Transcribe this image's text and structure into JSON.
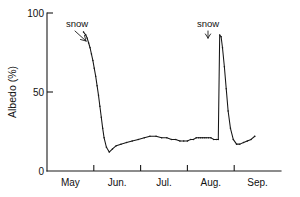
{
  "chart_data": {
    "type": "line",
    "title": "",
    "xlabel": "",
    "ylabel": "Albedo (%)",
    "ylim": [
      0,
      100
    ],
    "yticks": [
      0,
      50,
      100
    ],
    "ytick_labels": [
      "0",
      "50",
      "100"
    ],
    "xlim": [
      0,
      5
    ],
    "xtick_labels": [
      "May",
      "Jun.",
      "Jul.",
      "Aug.",
      "Sep."
    ],
    "x_tick_positions": [
      1,
      2,
      3,
      4
    ],
    "grid": false,
    "legend": false,
    "series": [
      {
        "name": "Albedo",
        "x": [
          0.78,
          0.83,
          0.86,
          0.89,
          0.92,
          0.95,
          0.98,
          1.01,
          1.04,
          1.07,
          1.1,
          1.13,
          1.16,
          1.19,
          1.22,
          1.27,
          1.33,
          1.4,
          1.48,
          1.58,
          1.7,
          1.82,
          1.95,
          2.08,
          2.2,
          2.33,
          2.45,
          2.56,
          2.66,
          2.75,
          2.84,
          2.92,
          3.0,
          3.07,
          3.13,
          3.19,
          3.24,
          3.28,
          3.32,
          3.36,
          3.4,
          3.45,
          3.5,
          3.56,
          3.62,
          3.66,
          3.69,
          3.72,
          3.75,
          3.79,
          3.83,
          3.87,
          3.92,
          3.98,
          4.05,
          4.12,
          4.2,
          4.28,
          4.36,
          4.44
        ],
        "values": [
          88,
          86,
          84,
          81,
          78,
          74,
          70,
          65,
          60,
          54,
          48,
          41,
          34,
          27,
          21,
          15,
          12,
          14,
          16,
          17,
          18,
          19,
          20,
          21,
          22,
          22,
          21,
          21,
          20,
          20,
          19,
          19,
          19,
          20,
          20,
          21,
          21,
          21,
          21,
          21,
          21,
          21,
          21,
          20,
          20,
          20,
          86,
          85,
          78,
          66,
          52,
          38,
          27,
          20,
          17,
          17,
          18,
          19,
          20,
          22
        ]
      }
    ],
    "annotations": [
      {
        "text": "snow",
        "x": 0.64,
        "y": 92,
        "leader_to_x": 0.82,
        "leader_to_y": 84
      },
      {
        "text": "snow",
        "x": 3.72,
        "y": 92,
        "leader_to_x": 3.7,
        "leader_to_y": 86
      }
    ]
  }
}
